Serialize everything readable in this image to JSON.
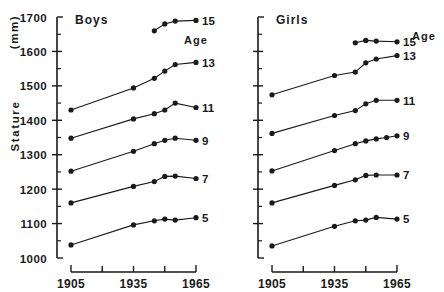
{
  "figure": {
    "axis_title_stature": "Stature",
    "axis_title_units": "(mm)"
  },
  "chart_data": {
    "type": "line",
    "title": "",
    "xlabel": "",
    "ylabel": "Stature (mm)",
    "xlim": [
      1900,
      1968
    ],
    "ylim": [
      1000,
      1700
    ],
    "grid": false,
    "legend": "right-of-series (age labels at line ends)",
    "y_ticks": [
      1000,
      1100,
      1200,
      1300,
      1400,
      1500,
      1600,
      1700
    ],
    "y_ticks_minor": [
      1050,
      1150,
      1250,
      1350,
      1450,
      1550,
      1650
    ],
    "x_ticks": [
      1905,
      1920,
      1935,
      1950,
      1965
    ],
    "x_tick_labels": [
      "1905",
      "",
      "1935",
      "",
      "1965"
    ],
    "panels": [
      {
        "name": "boys",
        "title": "Boys",
        "age_caption": "Age",
        "series": [
          {
            "name": "15",
            "label": "15",
            "x": [
              1945,
              1950,
              1955,
              1965
            ],
            "values": [
              1660,
              1680,
              1688,
              1690
            ]
          },
          {
            "name": "13",
            "label": "13",
            "x": [
              1905,
              1935,
              1945,
              1950,
              1955,
              1965
            ],
            "values": [
              1430,
              1494,
              1522,
              1543,
              1562,
              1568
            ]
          },
          {
            "name": "11",
            "label": "11",
            "x": [
              1905,
              1935,
              1945,
              1950,
              1955,
              1965
            ],
            "values": [
              1348,
              1404,
              1419,
              1430,
              1450,
              1437
            ]
          },
          {
            "name": "9",
            "label": "9",
            "x": [
              1905,
              1935,
              1945,
              1950,
              1955,
              1965
            ],
            "values": [
              1252,
              1310,
              1332,
              1342,
              1348,
              1342
            ]
          },
          {
            "name": "7",
            "label": "7",
            "x": [
              1905,
              1935,
              1945,
              1950,
              1955,
              1965
            ],
            "values": [
              1160,
              1208,
              1222,
              1237,
              1238,
              1231
            ]
          },
          {
            "name": "5",
            "label": "5",
            "x": [
              1905,
              1935,
              1945,
              1950,
              1955,
              1965
            ],
            "values": [
              1038,
              1096,
              1108,
              1113,
              1110,
              1117
            ]
          }
        ]
      },
      {
        "name": "girls",
        "title": "Girls",
        "age_caption": "Age",
        "series": [
          {
            "name": "15",
            "label": "15",
            "x": [
              1945,
              1950,
              1955,
              1965
            ],
            "values": [
              1625,
              1632,
              1630,
              1628
            ]
          },
          {
            "name": "13",
            "label": "13",
            "x": [
              1905,
              1935,
              1945,
              1950,
              1955,
              1965
            ],
            "values": [
              1474,
              1530,
              1540,
              1567,
              1578,
              1588
            ]
          },
          {
            "name": "11",
            "label": "11",
            "x": [
              1905,
              1935,
              1945,
              1950,
              1955,
              1965
            ],
            "values": [
              1362,
              1414,
              1428,
              1448,
              1458,
              1458
            ]
          },
          {
            "name": "9",
            "label": "9",
            "x": [
              1905,
              1935,
              1945,
              1950,
              1955,
              1960,
              1965
            ],
            "values": [
              1253,
              1312,
              1332,
              1340,
              1346,
              1350,
              1355
            ]
          },
          {
            "name": "7",
            "label": "7",
            "x": [
              1905,
              1935,
              1945,
              1950,
              1955,
              1965
            ],
            "values": [
              1160,
              1211,
              1227,
              1240,
              1241,
              1241
            ]
          },
          {
            "name": "5",
            "label": "5",
            "x": [
              1905,
              1935,
              1945,
              1950,
              1955,
              1965
            ],
            "values": [
              1035,
              1092,
              1108,
              1110,
              1118,
              1113
            ]
          }
        ]
      }
    ]
  }
}
